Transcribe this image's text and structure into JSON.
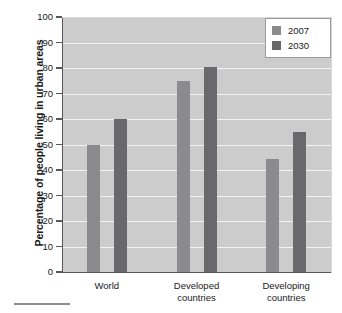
{
  "chart_data": {
    "type": "bar",
    "title": "",
    "subtitle": "",
    "xlabel": "",
    "ylabel": "Percentage of people living in urban areas",
    "categories": [
      "World",
      "Developed countries",
      "Developing countries"
    ],
    "category_lines": [
      [
        "World"
      ],
      [
        "Developed",
        "countries"
      ],
      [
        "Developing",
        "countries"
      ]
    ],
    "series": [
      {
        "name": "2007",
        "values": [
          50,
          75,
          44.5
        ],
        "color": "#8b8b8d"
      },
      {
        "name": "2030",
        "values": [
          60,
          80.5,
          55
        ],
        "color": "#69696b"
      }
    ],
    "ylim": [
      0,
      100
    ],
    "ytick_step": 10,
    "yticks": [
      "100",
      "90",
      "80",
      "70",
      "60",
      "50",
      "40",
      "30",
      "20",
      "10",
      "0"
    ],
    "grid": true,
    "grid_axis": "y",
    "legend_position": "top-right",
    "legend_entries": [
      "2007",
      "2030"
    ],
    "plot_background": "#cccccc",
    "gridline_color": "#f2f2f2",
    "axis_color": "#58585a"
  }
}
